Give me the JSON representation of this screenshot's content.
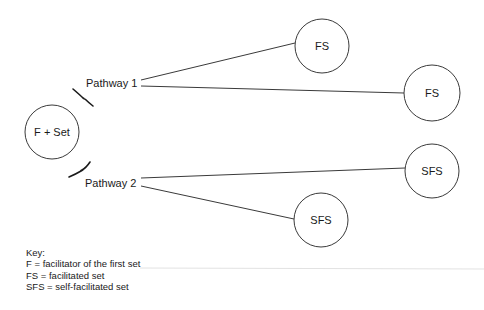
{
  "diagram": {
    "origin_node": {
      "label": "F + Set",
      "cx": 52,
      "cy": 132,
      "r": 27
    },
    "pathways": [
      {
        "label": "Pathway 1",
        "label_x": 86,
        "label_y": 83,
        "brace": "M73 89 Q80 95 83 98 Q86 100 85 99 Q88 102 93 106",
        "targets": [
          {
            "label": "FS",
            "cx": 322,
            "cy": 46,
            "r": 27,
            "edge": [
              141,
              80,
              295,
              43
            ]
          },
          {
            "label": "FS",
            "cx": 432,
            "cy": 93,
            "r": 28,
            "edge": [
              141,
              86,
              404,
              93
            ]
          }
        ]
      },
      {
        "label": "Pathway 2",
        "label_x": 85,
        "label_y": 183,
        "brace": "M90 162 Q86 168 82 170 Q80 171 81 171 Q76 174 69 177",
        "targets": [
          {
            "label": "SFS",
            "cx": 432,
            "cy": 171,
            "r": 27,
            "edge": [
              141,
              178,
              405,
              168
            ]
          },
          {
            "label": "SFS",
            "cx": 321,
            "cy": 220,
            "r": 27,
            "edge": [
              141,
              186,
              294,
              219
            ]
          }
        ]
      }
    ],
    "colors": {
      "stroke": "#3a3a3a",
      "text": "#1a1a1a",
      "background": "#ffffff"
    }
  },
  "key": {
    "title": "Key:",
    "entries": [
      "F = facilitator of the first set",
      "FS = facilitated set",
      "SFS = self-facilitated set"
    ]
  }
}
